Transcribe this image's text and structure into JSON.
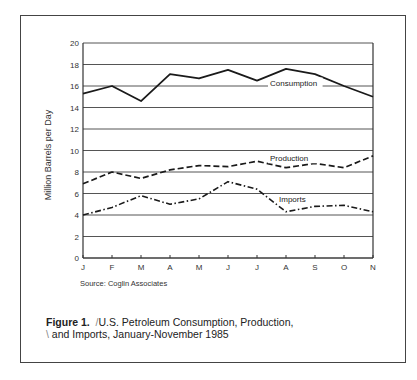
{
  "chart_data": {
    "type": "line",
    "xlabel": "",
    "ylabel": "Million Barrels per Day",
    "ylim": [
      0,
      20
    ],
    "yticks": [
      0,
      2,
      4,
      6,
      8,
      10,
      12,
      14,
      16,
      18,
      20
    ],
    "grid": true,
    "legend_position": "inline labels",
    "categories": [
      "J",
      "F",
      "M",
      "A",
      "M",
      "J",
      "J",
      "A",
      "S",
      "O",
      "N"
    ],
    "series": [
      {
        "name": "Consumption",
        "style": "solid",
        "values": [
          15.3,
          16.0,
          14.6,
          17.1,
          16.7,
          17.5,
          16.5,
          17.6,
          17.1,
          16.0,
          15.0
        ]
      },
      {
        "name": "Production",
        "style": "dashed",
        "values": [
          6.9,
          8.0,
          7.4,
          8.2,
          8.6,
          8.5,
          9.0,
          8.4,
          8.8,
          8.4,
          9.5
        ]
      },
      {
        "name": "Imports",
        "style": "dash-dot",
        "values": [
          4.0,
          4.7,
          5.8,
          5.0,
          5.5,
          7.1,
          6.4,
          4.3,
          4.8,
          4.9,
          4.3
        ]
      }
    ]
  },
  "labels": {
    "ylabel": "Million Barrels per Day",
    "source": "Source:  Coglin Associates",
    "figure_number": "Figure 1.",
    "caption_line1": "U.S. Petroleum Consumption, Production,",
    "caption_line2": "and Imports, January-November 1985"
  }
}
